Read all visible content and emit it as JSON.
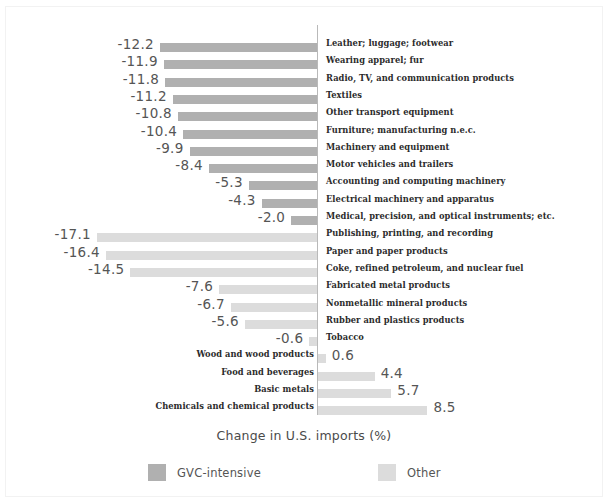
{
  "chart_data": {
    "type": "bar",
    "orientation": "horizontal",
    "title": "",
    "xlabel": "Change in U.S. imports (%)",
    "ylabel": "",
    "grid": false,
    "axis_zero_line": true,
    "xlim": [
      -18,
      10
    ],
    "legend_position": "bottom",
    "legend": [
      {
        "name": "GVC-intensive",
        "color": "#b0b0b0"
      },
      {
        "name": "Other",
        "color": "#dcdcdc"
      }
    ],
    "series": [
      {
        "name": "GVC-intensive",
        "color": "#b0b0b0",
        "points": [
          {
            "category": "Leather; luggage; footwear",
            "value": -12.2,
            "label": "-12.2"
          },
          {
            "category": "Wearing apparel; fur",
            "value": -11.9,
            "label": "-11.9"
          },
          {
            "category": "Radio, TV, and communication products",
            "value": -11.8,
            "label": "-11.8"
          },
          {
            "category": "Textiles",
            "value": -11.2,
            "label": "-11.2"
          },
          {
            "category": "Other transport equipment",
            "value": -10.8,
            "label": "-10.8"
          },
          {
            "category": "Furniture; manufacturing n.e.c.",
            "value": -10.4,
            "label": "-10.4"
          },
          {
            "category": "Machinery and equipment",
            "value": -9.9,
            "label": "-9.9"
          },
          {
            "category": "Motor vehicles and trailers",
            "value": -8.4,
            "label": "-8.4"
          },
          {
            "category": "Accounting and computing machinery",
            "value": -5.3,
            "label": "-5.3"
          },
          {
            "category": "Electrical machinery and apparatus",
            "value": -4.3,
            "label": "-4.3"
          },
          {
            "category": "Medical, precision, and optical instruments; etc.",
            "value": -2.0,
            "label": "-2.0"
          }
        ]
      },
      {
        "name": "Other",
        "color": "#dcdcdc",
        "points": [
          {
            "category": "Publishing, printing, and recording",
            "value": -17.1,
            "label": "-17.1"
          },
          {
            "category": "Paper and paper products",
            "value": -16.4,
            "label": "-16.4"
          },
          {
            "category": "Coke, refined petroleum, and nuclear fuel",
            "value": -14.5,
            "label": "-14.5"
          },
          {
            "category": "Fabricated metal products",
            "value": -7.6,
            "label": "-7.6"
          },
          {
            "category": "Nonmetallic mineral products",
            "value": -6.7,
            "label": "-6.7"
          },
          {
            "category": "Rubber and plastics products",
            "value": -5.6,
            "label": "-5.6"
          },
          {
            "category": "Tobacco",
            "value": -0.6,
            "label": "-0.6"
          },
          {
            "category": "Wood and wood products",
            "value": 0.6,
            "label": "0.6"
          },
          {
            "category": "Food and beverages",
            "value": 4.4,
            "label": "4.4"
          },
          {
            "category": "Basic metals",
            "value": 5.7,
            "label": "5.7"
          },
          {
            "category": "Chemicals and chemical products",
            "value": 8.5,
            "label": "8.5"
          }
        ]
      }
    ]
  }
}
